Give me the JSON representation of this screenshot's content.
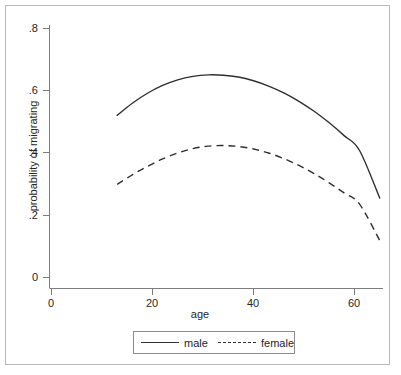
{
  "chart_data": {
    "type": "line",
    "title": "",
    "subtitle": "",
    "xlabel": "age",
    "ylabel": "probability of migrating",
    "xlim": [
      0,
      66
    ],
    "ylim": [
      0,
      0.8
    ],
    "xticks": [
      0,
      20,
      40,
      60
    ],
    "xtick_labels": [
      "0",
      "20",
      "40",
      "60"
    ],
    "yticks": [
      0,
      0.2,
      0.4,
      0.6,
      0.8
    ],
    "ytick_labels": [
      "0",
      ".2",
      ".4",
      ".6",
      ".8"
    ],
    "grid": false,
    "legend_position": "bottom",
    "legend_entries": [
      {
        "name": "male",
        "style": "solid"
      },
      {
        "name": "female",
        "style": "dashed"
      }
    ],
    "x": [
      13,
      16,
      19,
      22,
      25,
      28,
      31,
      34,
      37,
      40,
      43,
      46,
      49,
      52,
      55,
      58,
      61,
      65
    ],
    "series": [
      {
        "name": "male",
        "style": "solid",
        "color": "#2f2f2f",
        "values": [
          0.521,
          0.56,
          0.592,
          0.617,
          0.635,
          0.646,
          0.651,
          0.65,
          0.644,
          0.632,
          0.615,
          0.593,
          0.566,
          0.534,
          0.497,
          0.455,
          0.408,
          0.255
        ]
      },
      {
        "name": "female",
        "style": "dashed",
        "color": "#2f2f2f",
        "values": [
          0.299,
          0.33,
          0.357,
          0.381,
          0.4,
          0.414,
          0.422,
          0.424,
          0.421,
          0.413,
          0.4,
          0.382,
          0.36,
          0.334,
          0.304,
          0.271,
          0.236,
          0.119
        ]
      }
    ]
  },
  "axes": {
    "y_title": "probability of migrating",
    "x_title": "age",
    "ytick_0": "0",
    "ytick_1": ".2",
    "ytick_2": ".4",
    "ytick_3": ".6",
    "ytick_4": ".8",
    "xtick_0": "0",
    "xtick_1": "20",
    "xtick_2": "40",
    "xtick_3": "60"
  },
  "legend": {
    "male_label": "male",
    "female_label": "female"
  },
  "colors": {
    "line": "#2f2f2f",
    "axis": "#7d7d7d",
    "frame": "#b9b9b9",
    "text": "#262626",
    "background": "#ffffff"
  }
}
